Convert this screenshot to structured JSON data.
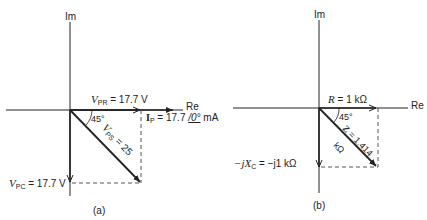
{
  "panel_a": {
    "caption": "(a)",
    "axis_im": "Im",
    "axis_re": "Re",
    "v_pr": {
      "sym": "V",
      "sub": "PR",
      "value": "= 17.7 V"
    },
    "i_p": {
      "sym": "I",
      "sub": "P",
      "value": "= 17.7",
      "angle": "/0°",
      "unit": "mA"
    },
    "v_ps": {
      "sym": "V",
      "sub": "PS",
      "value": "= 25"
    },
    "v_pc": {
      "sym": "V",
      "sub": "PC",
      "value": "= 17.7 V"
    },
    "angle": "45°"
  },
  "panel_b": {
    "caption": "(b)",
    "axis_im": "Im",
    "axis_re": "Re",
    "r": {
      "sym": "R",
      "value": "= 1 kΩ"
    },
    "z": {
      "sym": "Z",
      "value": "= 1.414",
      "unit": "kΩ"
    },
    "xc": {
      "pre": "−j",
      "sym": "X",
      "sub": "C",
      "value": "= −j1 kΩ"
    },
    "angle": "45°"
  },
  "colors": {
    "ink": "#222222",
    "dashed": "#555555"
  }
}
